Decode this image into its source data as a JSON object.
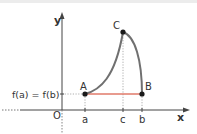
{
  "diagram": {
    "title": "",
    "axes": {
      "x_label": "x",
      "y_label": "y",
      "origin_label": "O"
    },
    "ticks": {
      "a": "a",
      "c": "c",
      "b": "b"
    },
    "y_value_label": "f(a) = f(b)",
    "points": {
      "A": "A",
      "B": "B",
      "C": "C"
    },
    "colors": {
      "curve": "#707070",
      "segment": "#e07a6a",
      "axis": "#444444",
      "point": "#1a1a1a",
      "guide": "#999999"
    }
  }
}
